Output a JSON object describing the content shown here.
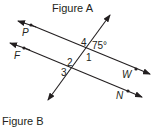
{
  "figure_a": {
    "title": "Figure A",
    "points": {
      "p": "P",
      "f": "F",
      "w": "W",
      "n": "N"
    },
    "angles": {
      "a1": "1",
      "a2": "2",
      "a3": "3",
      "a4": "4",
      "given": "75°"
    }
  },
  "figure_b": {
    "title": "Figure B"
  },
  "colors": {
    "ink": "#231f20",
    "background": "#ffffff"
  }
}
